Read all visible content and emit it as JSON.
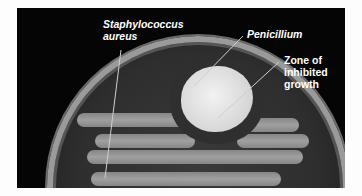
{
  "figure": {
    "labels": {
      "staph_line1": "Staphylococcus",
      "staph_line2": "aureus",
      "penicillium": "Penicillium",
      "zone_line1": "Zone of",
      "zone_line2": "inhibited",
      "zone_line3": "growth"
    },
    "colors": {
      "background": "#050505",
      "label_text": "#ffffff",
      "colony": "#e6e6e6"
    }
  }
}
